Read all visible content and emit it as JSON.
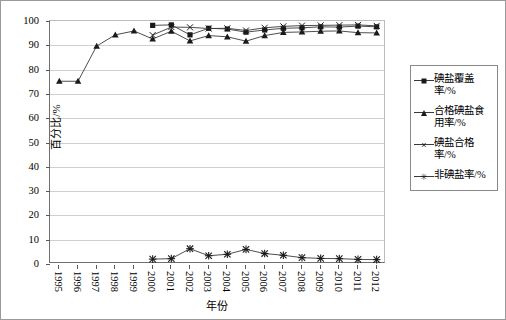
{
  "chart_data": {
    "type": "line",
    "title": "",
    "xlabel": "年份",
    "ylabel": "百分比/%",
    "ylim": [
      0,
      100
    ],
    "ytick_step": 10,
    "yticks": [
      0,
      10,
      20,
      30,
      40,
      50,
      60,
      70,
      80,
      90,
      100
    ],
    "grid": true,
    "legend_position": "right",
    "categories": [
      "1995",
      "1996",
      "1997",
      "1998",
      "1999",
      "2000",
      "2001",
      "2002",
      "2003",
      "2004",
      "2005",
      "2006",
      "2007",
      "2008",
      "2009",
      "2010",
      "2011",
      "2012"
    ],
    "series": [
      {
        "name": "碘盐覆盖率/%",
        "marker": "square",
        "values": [
          null,
          null,
          null,
          null,
          null,
          98.2,
          98.4,
          94.3,
          97.0,
          96.7,
          95.4,
          96.3,
          97.0,
          97.2,
          97.6,
          97.5,
          97.9,
          97.6
        ]
      },
      {
        "name": "合格碘盐食用率/%",
        "marker": "triangle",
        "values": [
          75.2,
          75.2,
          89.7,
          94.3,
          95.9,
          92.6,
          95.8,
          91.8,
          94.0,
          93.5,
          91.7,
          94.0,
          95.3,
          95.5,
          95.8,
          95.9,
          95.2,
          95.1
        ]
      },
      {
        "name": "碘盐合格率/%",
        "marker": "cross",
        "values": [
          null,
          null,
          null,
          null,
          null,
          94.2,
          97.5,
          97.4,
          96.9,
          97.0,
          96.1,
          97.2,
          97.8,
          98.1,
          98.2,
          98.3,
          98.4,
          98.0
        ]
      },
      {
        "name": "非碘盐率/%",
        "marker": "star",
        "values": [
          null,
          null,
          null,
          null,
          null,
          2.0,
          2.2,
          6.3,
          3.4,
          4.0,
          6.0,
          4.3,
          3.6,
          2.6,
          2.3,
          2.2,
          1.9,
          1.8
        ]
      }
    ]
  },
  "legend": {
    "items": [
      {
        "label": "碘盐覆盖率/%",
        "marker": "square"
      },
      {
        "label": "合格碘盐食用率/%",
        "marker": "triangle"
      },
      {
        "label": "碘盐合格率/%",
        "marker": "cross"
      },
      {
        "label": "非碘盐率/%",
        "marker": "star"
      }
    ]
  },
  "colors": {
    "line": "#3a3a3a",
    "marker": "#1a1a1a",
    "grid": "#cfcfcf",
    "axis": "#6f6f6f",
    "border": "#9a9a9a",
    "background": "#ffffff"
  }
}
